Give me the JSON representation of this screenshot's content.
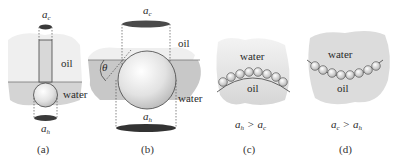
{
  "panels": [
    {
      "id": "a",
      "caption": "(a)",
      "top_label": "a",
      "top_label_sub": "c",
      "bottom_label": "a",
      "bottom_label_sub": "h",
      "upper_phase": "oil",
      "lower_phase": "water"
    },
    {
      "id": "b",
      "caption": "(b)",
      "top_label": "a",
      "top_label_sub": "c",
      "bottom_label": "a",
      "bottom_label_sub": "h",
      "upper_phase": "oil",
      "lower_phase": "water",
      "angle_label": "θ"
    },
    {
      "id": "c",
      "caption": "(c)",
      "upper_phase": "water",
      "lower_phase": "oil",
      "relation": {
        "left": "a",
        "left_sub": "h",
        "op": ">",
        "right": "a",
        "right_sub": "c"
      }
    },
    {
      "id": "d",
      "caption": "(d)",
      "upper_phase": "water",
      "lower_phase": "oil",
      "relation": {
        "left": "a",
        "left_sub": "c",
        "op": ">",
        "right": "a",
        "right_sub": "h"
      }
    }
  ],
  "colors": {
    "oil_region": "#ececec",
    "water_region": "#cfcfcf",
    "interface_line": "#777777",
    "ellipse_dark": "#3a3a3a",
    "outline": "#444444"
  }
}
